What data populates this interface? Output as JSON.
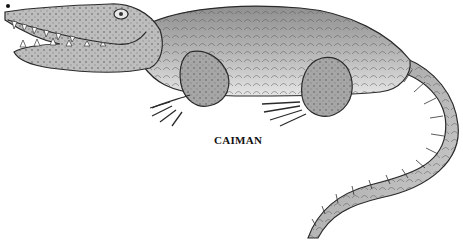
{
  "illustration": {
    "subject": "caiman",
    "style": "pencil sketch",
    "caption": "CAIMAN",
    "colors": {
      "background": "#ffffff",
      "body_light": "#d4d4d4",
      "body_mid": "#9a9a9a",
      "outline": "#2a2a2a",
      "caption": "#111111"
    }
  }
}
